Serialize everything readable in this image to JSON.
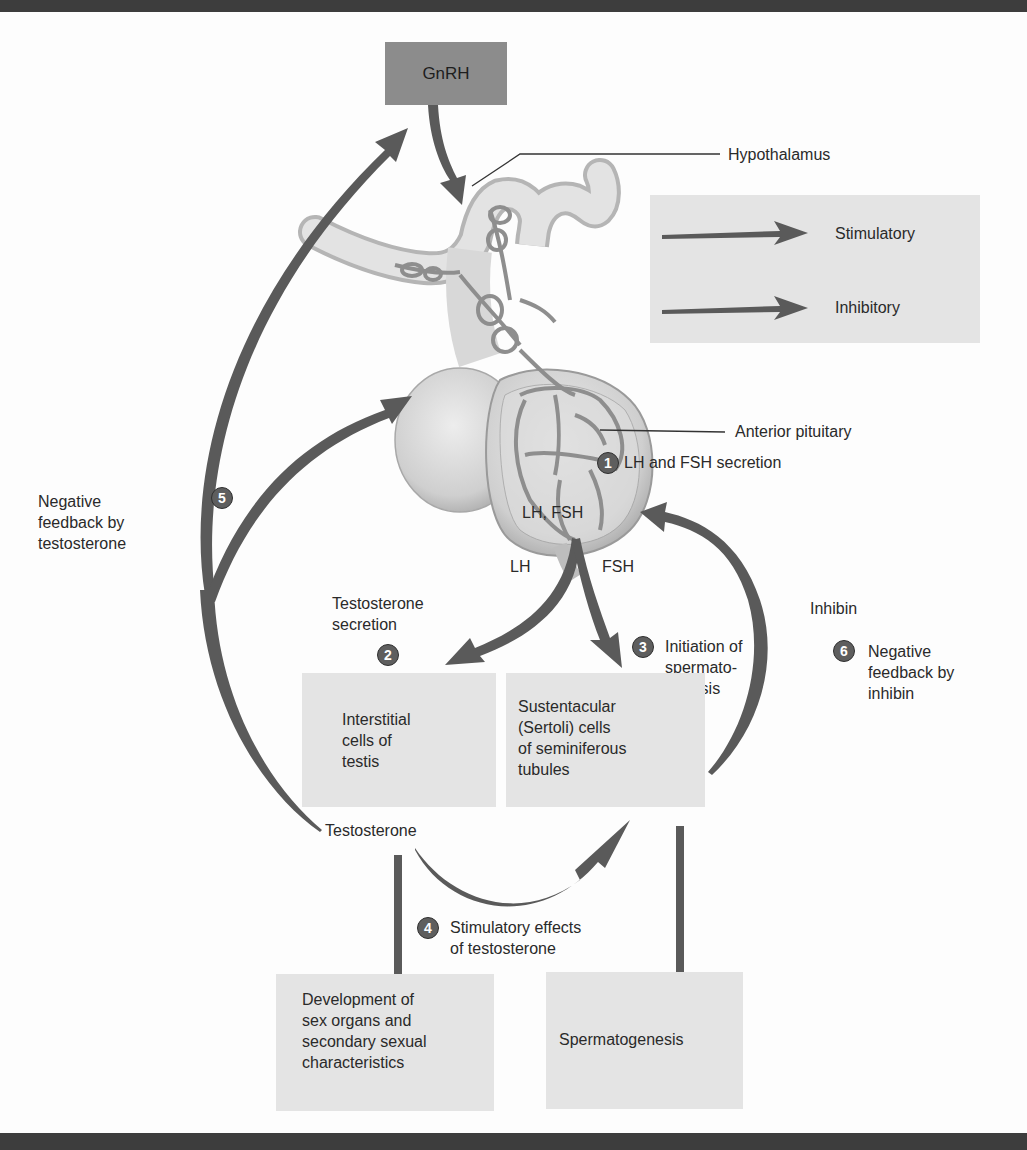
{
  "figure": {
    "hormones": {
      "gnrh": "GnRH",
      "lh_fsh": "LH, FSH",
      "lh": "LH",
      "fsh": "FSH",
      "testosterone": "Testosterone",
      "inhibin": "Inhibin"
    },
    "structures": {
      "hypothalamus": "Hypothalamus",
      "anterior_pituitary": "Anterior pituitary"
    },
    "legend": {
      "stimulatory": "Stimulatory",
      "inhibitory": "Inhibitory"
    },
    "boxes": {
      "interstitial": "Interstitial\ncells of\ntestis",
      "sertoli": "Sustentacular\n(Sertoli) cells\nof seminiferous\ntubules",
      "development": "Development of\nsex organs and\nsecondary sexual\ncharacteristics",
      "spermatogenesis": "Spermatogenesis"
    },
    "steps": [
      {
        "number": "1",
        "label": "LH and FSH secretion"
      },
      {
        "number": "2",
        "label": "Testosterone\nsecretion"
      },
      {
        "number": "3",
        "label": "Initiation of\nspermato-\ngenesis"
      },
      {
        "number": "4",
        "label": "Stimulatory effects\nof testosterone"
      },
      {
        "number": "5",
        "label": "Negative\nfeedback by\ntestosterone"
      },
      {
        "number": "6",
        "label": "Negative\nfeedback by\ninhibin"
      }
    ],
    "colors": {
      "arrow": "#5a5a5a",
      "box_fill": "#e4e4e4",
      "gnrh_fill": "#8c8c8c",
      "bar": "#3d3d3d"
    }
  }
}
